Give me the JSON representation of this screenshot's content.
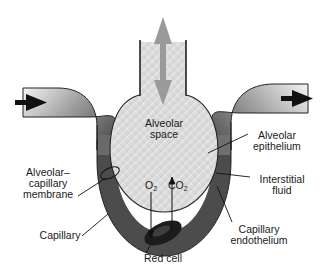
{
  "diagram": {
    "labels": {
      "alveolar_space_line1": "Alveolar",
      "alveolar_space_line2": "space",
      "alveolar_epithelium_line1": "Alveolar",
      "alveolar_epithelium_line2": "epithelium",
      "interstitial_fluid_line1": "Interstitial",
      "interstitial_fluid_line2": "fluid",
      "capillary_endothelium_line1": "Capillary",
      "capillary_endothelium_line2": "endothelium",
      "membrane_line1": "Alveolar–",
      "membrane_line2": "capillary",
      "membrane_line3": "membrane",
      "capillary": "Capillary",
      "red_cell": "Red cell"
    },
    "gases": {
      "o2_base": "O",
      "o2_sub": "2",
      "co2_base": "CO",
      "co2_sub": "2"
    },
    "flow": {
      "blood_in": "left-arrow-in",
      "blood_out": "right-arrow-out",
      "air": "bidirectional-vertical"
    },
    "colors": {
      "alveolus_fill": "#d4d4d4",
      "capillary_dark": "#4a4a4a",
      "capillary_light": "#e8e8e8",
      "air_arrow": "#9a9a9a",
      "flow_arrow": "#111111",
      "red_cell": "#1c1c1c"
    }
  }
}
